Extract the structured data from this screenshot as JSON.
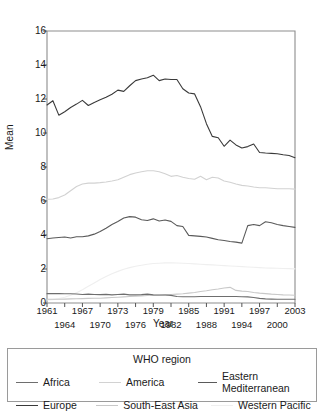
{
  "chart_data": {
    "type": "line",
    "title": "",
    "xlabel": "Year",
    "ylabel": "Mean",
    "xlim": [
      1961,
      2003
    ],
    "ylim": [
      0,
      16
    ],
    "grid": false,
    "legend_position": "bottom",
    "legend_title": "WHO region",
    "ytick_labels": [
      "0",
      "2",
      "4",
      "6",
      "8",
      "10",
      "12",
      "14",
      "16"
    ],
    "ytick_values": [
      0,
      2,
      4,
      6,
      8,
      10,
      12,
      14,
      16
    ],
    "xtick_labels_top": [
      "1961",
      "1967",
      "1973",
      "1979",
      "1985",
      "1991",
      "1997",
      "2003"
    ],
    "xtick_values_top": [
      1961,
      1967,
      1973,
      1979,
      1985,
      1991,
      1997,
      2003
    ],
    "xtick_labels_bottom": [
      "1964",
      "1970",
      "1976",
      "1982",
      "1988",
      "1994",
      "2000"
    ],
    "xtick_values_bottom": [
      1964,
      1970,
      1976,
      1982,
      1988,
      1994,
      2000
    ],
    "x": [
      1961,
      1962,
      1963,
      1964,
      1965,
      1966,
      1967,
      1968,
      1969,
      1970,
      1971,
      1972,
      1973,
      1974,
      1975,
      1976,
      1977,
      1978,
      1979,
      1980,
      1981,
      1982,
      1983,
      1984,
      1985,
      1986,
      1987,
      1988,
      1989,
      1990,
      1991,
      1992,
      1993,
      1994,
      1995,
      1996,
      1997,
      1998,
      1999,
      2000,
      2001,
      2002,
      2003
    ],
    "series": [
      {
        "name": "Africa",
        "color": "#6e6e6e",
        "values": [
          0.55,
          0.55,
          0.55,
          0.54,
          0.54,
          0.53,
          0.5,
          0.52,
          0.5,
          0.49,
          0.51,
          0.48,
          0.5,
          0.52,
          0.48,
          0.48,
          0.49,
          0.52,
          0.48,
          0.47,
          0.47,
          0.45,
          0.38,
          0.37,
          0.37,
          0.37,
          0.38,
          0.38,
          0.38,
          0.38,
          0.38,
          0.38,
          0.38,
          0.37,
          0.36,
          0.32,
          0.27,
          0.24,
          0.23,
          0.22,
          0.22,
          0.22,
          0.22
        ]
      },
      {
        "name": "America",
        "color": "#d2d2d2",
        "values": [
          6.1,
          6.12,
          6.2,
          6.35,
          6.6,
          6.85,
          7.0,
          7.05,
          7.05,
          7.08,
          7.12,
          7.18,
          7.25,
          7.4,
          7.55,
          7.65,
          7.72,
          7.78,
          7.78,
          7.72,
          7.6,
          7.45,
          7.5,
          7.4,
          7.32,
          7.28,
          7.45,
          7.25,
          7.4,
          7.35,
          7.18,
          7.1,
          7.0,
          6.92,
          6.88,
          6.82,
          6.78,
          6.78,
          6.75,
          6.72,
          6.72,
          6.72,
          6.7
        ]
      },
      {
        "name": "Eastern Mediterranean",
        "color": "#5a5a5a",
        "values": [
          3.78,
          3.82,
          3.85,
          3.88,
          3.82,
          3.9,
          3.9,
          3.95,
          4.05,
          4.2,
          4.4,
          4.62,
          4.8,
          5.0,
          5.08,
          5.05,
          4.9,
          4.85,
          4.95,
          4.82,
          4.88,
          4.8,
          4.55,
          4.5,
          3.98,
          3.95,
          3.92,
          3.88,
          3.8,
          3.72,
          3.68,
          3.62,
          3.58,
          3.52,
          4.55,
          4.62,
          4.55,
          4.78,
          4.72,
          4.62,
          4.55,
          4.5,
          4.45
        ]
      },
      {
        "name": "Europe",
        "color": "#3a3a3a",
        "values": [
          11.65,
          11.9,
          11.05,
          11.25,
          11.5,
          11.7,
          11.92,
          11.62,
          11.8,
          11.95,
          12.1,
          12.28,
          12.52,
          12.45,
          12.78,
          13.08,
          13.18,
          13.25,
          13.4,
          13.08,
          13.18,
          13.15,
          13.15,
          12.6,
          12.35,
          12.3,
          11.55,
          10.55,
          9.8,
          9.72,
          9.22,
          9.58,
          9.3,
          9.12,
          9.2,
          9.35,
          8.85,
          8.82,
          8.8,
          8.78,
          8.72,
          8.68,
          8.55
        ]
      },
      {
        "name": "South-East Asia",
        "color": "#c8c8c8",
        "values": [
          0.22,
          0.22,
          0.22,
          0.23,
          0.24,
          0.25,
          0.26,
          0.27,
          0.28,
          0.28,
          0.3,
          0.32,
          0.34,
          0.36,
          0.38,
          0.4,
          0.42,
          0.44,
          0.46,
          0.46,
          0.48,
          0.5,
          0.52,
          0.54,
          0.58,
          0.62,
          0.68,
          0.72,
          0.78,
          0.82,
          0.88,
          0.92,
          0.74,
          0.7,
          0.68,
          0.62,
          0.58,
          0.55,
          0.52,
          0.5,
          0.48,
          0.47,
          0.46
        ]
      },
      {
        "name": "Western Pacific",
        "color": "#efefef",
        "values": [
          0.18,
          0.2,
          0.26,
          0.34,
          0.45,
          0.6,
          0.78,
          0.98,
          1.18,
          1.38,
          1.56,
          1.72,
          1.86,
          1.98,
          2.08,
          2.16,
          2.22,
          2.28,
          2.32,
          2.34,
          2.36,
          2.36,
          2.35,
          2.34,
          2.32,
          2.3,
          2.28,
          2.26,
          2.24,
          2.22,
          2.2,
          2.18,
          2.16,
          2.14,
          2.12,
          2.1,
          2.08,
          2.06,
          2.05,
          2.04,
          2.03,
          2.02,
          2.01
        ]
      }
    ]
  },
  "axis": {
    "y_label": "Mean",
    "x_label": "Year"
  },
  "legend": {
    "title": "WHO region",
    "row1": [
      {
        "label": "Africa"
      },
      {
        "label": "America"
      },
      {
        "label": "Eastern Mediterranean"
      }
    ],
    "row2": [
      {
        "label": "Europe"
      },
      {
        "label": "South-East Asia"
      },
      {
        "label": "Western Pacific"
      }
    ]
  }
}
